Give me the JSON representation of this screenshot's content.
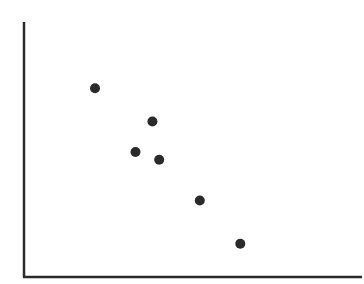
{
  "chart_data": {
    "type": "scatter",
    "title": "",
    "xlabel": "",
    "ylabel": "",
    "xlim": [
      0,
      10
    ],
    "ylim": [
      0,
      10
    ],
    "grid": false,
    "legend": null,
    "tick_labels": {
      "x": [],
      "y": []
    },
    "series": [
      {
        "name": "points",
        "color": "#2a2a2a",
        "marker": "circle",
        "x": [
          2.1,
          3.8,
          3.3,
          4.0,
          5.2,
          6.4
        ],
        "y": [
          7.4,
          6.1,
          4.9,
          4.6,
          3.0,
          1.3
        ]
      }
    ],
    "annotations": []
  },
  "style": {
    "axis_color": "#2a2a2a",
    "background": "#ffffff",
    "plot_area": {
      "left": 24,
      "right": 362,
      "top": 22,
      "bottom": 277
    },
    "marker_radius": 5
  }
}
